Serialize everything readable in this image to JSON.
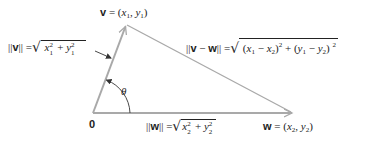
{
  "diagram": {
    "type": "vector-triangle",
    "colors": {
      "line": "#a9a9a9",
      "text": "#222222",
      "annotation_arrow": "#333333",
      "background": "#ffffff"
    },
    "points": {
      "origin": {
        "label": "0",
        "x": 93,
        "y": 113
      },
      "v": {
        "x": 126,
        "y": 25
      },
      "w": {
        "x": 293,
        "y": 113
      }
    },
    "labels": {
      "v_point": {
        "name": "v",
        "eq": "=",
        "open": "(",
        "x": "x",
        "xsub": "1",
        "comma": ",",
        "y": "y",
        "ysub": "1",
        "close": ")"
      },
      "w_point": {
        "name": "w",
        "eq": "=",
        "open": "(",
        "x": "x",
        "xsub": "2",
        "comma": ",",
        "y": "y",
        "ysub": "2",
        "close": ")"
      },
      "origin": "0",
      "angle": "θ",
      "norm_v": {
        "lhs_open": "||",
        "name": "v",
        "lhs_close": "||",
        "eq": "=",
        "x": "x",
        "xsup": "2",
        "xsub": "1",
        "plus": "+",
        "y": "y",
        "ysup": "2",
        "ysub": "1"
      },
      "norm_w": {
        "lhs_open": "||",
        "name": "w",
        "lhs_close": "||",
        "eq": "=",
        "x": "x",
        "xsup": "2",
        "xsub": "2",
        "plus": "+",
        "y": "y",
        "ysup": "2",
        "ysub": "2"
      },
      "norm_v_minus_w": {
        "lhs_open": "||",
        "v": "v",
        "minus": "−",
        "w": "w",
        "lhs_close": "||",
        "eq": "=",
        "term1_open": "(",
        "x1": "x",
        "x1sub": "1",
        "minus1": "−",
        "x2": "x",
        "x2sub": "2",
        "term1_close": ")",
        "term1_sup": "2",
        "plus": "+",
        "term2_open": "(",
        "y1": "y",
        "y1sub": "1",
        "minus2": "−",
        "y2": "y",
        "y2sub": "2",
        "term2_close": ")",
        "term2_sup": "2"
      }
    },
    "radical_sign": "√"
  }
}
